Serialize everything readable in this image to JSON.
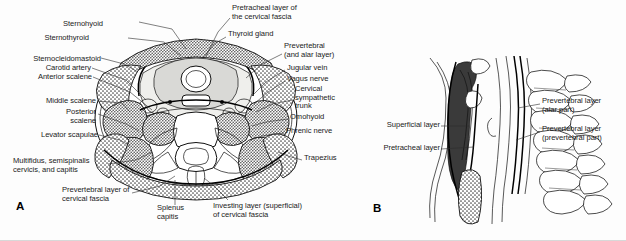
{
  "figure": {
    "panels": [
      {
        "letter": "A",
        "caption": "Axial (transverse) section of the neck"
      },
      {
        "letter": "B",
        "caption": "Sagittal section of the neck"
      }
    ],
    "ink_color": "#1b1b1b",
    "background_color": "#fdfdfd",
    "leader_color": "#2b2b2b"
  },
  "panel_a": {
    "letter": "A",
    "labels": [
      {
        "id": "sternohyoid",
        "text": "Sternohyoid",
        "align": "right",
        "x": 103,
        "y": 24
      },
      {
        "id": "sternothyroid",
        "text": "Sternothyroid",
        "align": "right",
        "x": 89,
        "y": 38
      },
      {
        "id": "sternocleidomastoid",
        "text": "Sternocleidomastoid",
        "align": "right",
        "x": 14,
        "y": 59
      },
      {
        "id": "carotid-artery",
        "text": "Carotid artery",
        "align": "right",
        "x": 52,
        "y": 68
      },
      {
        "id": "anterior-scalene",
        "text": "Anterior scalene",
        "align": "right",
        "x": 41,
        "y": 77
      },
      {
        "id": "middle-scalene",
        "text": "Middle scalene",
        "align": "right",
        "x": 44,
        "y": 100
      },
      {
        "id": "posterior-scalene",
        "text": "Posterior\nscalene",
        "align": "right",
        "x": 57,
        "y": 112
      },
      {
        "id": "levator-scapulae",
        "text": "Levator scapulae",
        "align": "right",
        "x": 39,
        "y": 135
      },
      {
        "id": "multifidus-semispinalis",
        "text": "Multifidus, semispinalis\ncervicis, and capitis",
        "align": "left",
        "x": 13,
        "y": 161
      },
      {
        "id": "prevertebral-layer-cervical-fascia",
        "text": "Prevertebral layer of\ncervical fascia",
        "align": "left",
        "x": 62,
        "y": 190
      },
      {
        "id": "splenus-capitis",
        "text": "Splenus\ncapitis",
        "align": "left",
        "x": 157,
        "y": 208
      },
      {
        "id": "investing-layer",
        "text": "Investing layer (superficial)\nof cervical fascia",
        "align": "left",
        "x": 213,
        "y": 206
      },
      {
        "id": "pretracheal-layer",
        "text": "Pretracheal layer of\nthe cervical fascia",
        "align": "left",
        "x": 232,
        "y": 6
      },
      {
        "id": "thyroid-gland",
        "text": "Thyroid gland",
        "align": "left",
        "x": 228,
        "y": 33
      },
      {
        "id": "prevertebral-alar",
        "text": "Prevertebral\n(and alar layer)",
        "align": "left",
        "x": 284,
        "y": 45
      },
      {
        "id": "jugular-vein",
        "text": "Jugular vein",
        "align": "left",
        "x": 287,
        "y": 67
      },
      {
        "id": "vagus-nerve",
        "text": "Vagus nerve",
        "align": "left",
        "x": 287,
        "y": 78
      },
      {
        "id": "cervical-sympathetic-trunk",
        "text": "Cervical\nsympathetic\ntrunk",
        "align": "left",
        "x": 295,
        "y": 88
      },
      {
        "id": "omohyoid",
        "text": "Omohyoid",
        "align": "left",
        "x": 290,
        "y": 116
      },
      {
        "id": "phrenic-nerve",
        "text": "Phrenic nerve",
        "align": "left",
        "x": 286,
        "y": 130
      },
      {
        "id": "trapezius",
        "text": "Trapezius",
        "align": "left",
        "x": 304,
        "y": 157
      }
    ]
  },
  "panel_b": {
    "letter": "B",
    "labels": [
      {
        "id": "superficial-layer",
        "text": "Superficial layer",
        "align": "right",
        "x": 372,
        "y": 124
      },
      {
        "id": "pretracheal-layer-b",
        "text": "Pretracheal layer",
        "align": "right",
        "x": 369,
        "y": 147
      },
      {
        "id": "prevertebral-layer-alar",
        "text": "Prevertebral layer\n(alar part)",
        "align": "left",
        "x": 542,
        "y": 100
      },
      {
        "id": "prevertebral-layer-prevertebral",
        "text": "Prevertebral layer\n(prevertebral part)",
        "align": "left",
        "x": 542,
        "y": 128
      }
    ]
  }
}
